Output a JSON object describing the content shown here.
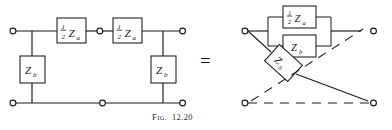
{
  "figure": {
    "caption_prefix": "F",
    "caption_prefix_small": "IG.",
    "caption_number": "12.20",
    "equals_sign": "=",
    "ink_color": "#1a1a1a",
    "background_color": "#ffffff"
  },
  "left_circuit": {
    "name": "T-network",
    "series_arm_1": {
      "coefficient": "1",
      "denominator": "2",
      "impedance": "Z",
      "subscript": "a"
    },
    "series_arm_2": {
      "coefficient": "1",
      "denominator": "2",
      "impedance": "Z",
      "subscript": "a"
    },
    "shunt_arm_left": {
      "impedance": "Z",
      "subscript": "b"
    },
    "shunt_arm_right": {
      "impedance": "Z",
      "subscript": "b"
    },
    "terminals": [
      "top-left",
      "top-middle",
      "top-right",
      "bottom-left",
      "bottom-middle",
      "bottom-right"
    ]
  },
  "right_circuit": {
    "name": "lattice-network",
    "series_branch_top": {
      "coefficient": "1",
      "denominator": "2",
      "impedance": "Z",
      "subscript": "a"
    },
    "parallel_branch": {
      "impedance": "Z",
      "subscript": "b"
    },
    "diagonal_branch": {
      "impedance": "Z",
      "subscript": "b"
    },
    "terminals": [
      "top-left",
      "top-right",
      "bottom-left",
      "bottom-right"
    ]
  }
}
